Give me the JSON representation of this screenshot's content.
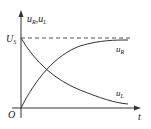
{
  "figure": {
    "y_axis_label": "u_R, u_L",
    "y_axis_label_main_1": "u",
    "y_axis_label_sub_1": "R",
    "y_axis_label_sep": ",",
    "y_axis_label_main_2": "u",
    "y_axis_label_sub_2": "L",
    "x_axis_label": "t",
    "origin_label": "O",
    "level_label_main": "U",
    "level_label_sub": "S",
    "curves": [
      {
        "name": "u_R",
        "label_main": "u",
        "label_sub": "R",
        "shape": "rising exponential from 0 to U_S"
      },
      {
        "name": "u_L",
        "label_main": "u",
        "label_sub": "L",
        "shape": "decaying exponential from U_S to 0"
      }
    ],
    "asymptote": {
      "label": "U_S",
      "style": "dashed"
    },
    "colors": {
      "line": "#333333",
      "background": "#ffffff"
    }
  }
}
